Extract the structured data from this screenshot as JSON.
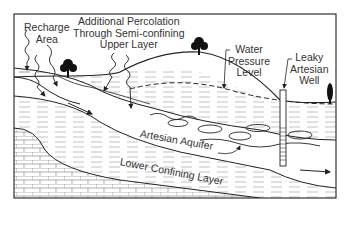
{
  "diagram": {
    "labels": {
      "recharge_area": [
        "Recharge",
        "Area"
      ],
      "additional_percolation": [
        "Additional Percolation",
        "Through Semi-confining",
        "Upper Layer"
      ],
      "water_pressure_level": [
        "Water",
        "Pressure",
        "Level"
      ],
      "leaky_artesian_well": [
        "Leaky",
        "Artesian",
        "Well"
      ],
      "artesian_aquifer": "Artesian Aquifer",
      "lower_confining_layer": "Lower Confining Layer"
    },
    "elements": [
      "ground-surface",
      "hill",
      "trees",
      "recharge-percolation-arrows",
      "semi-confining-upper-layer",
      "artesian-aquifer",
      "flow-arrows",
      "water-pressure-level-dashed",
      "leaky-artesian-well",
      "lower-confining-layer",
      "bedrock"
    ],
    "colors": {
      "line": "#222222",
      "background": "#ffffff",
      "hatch": "#888888"
    }
  }
}
